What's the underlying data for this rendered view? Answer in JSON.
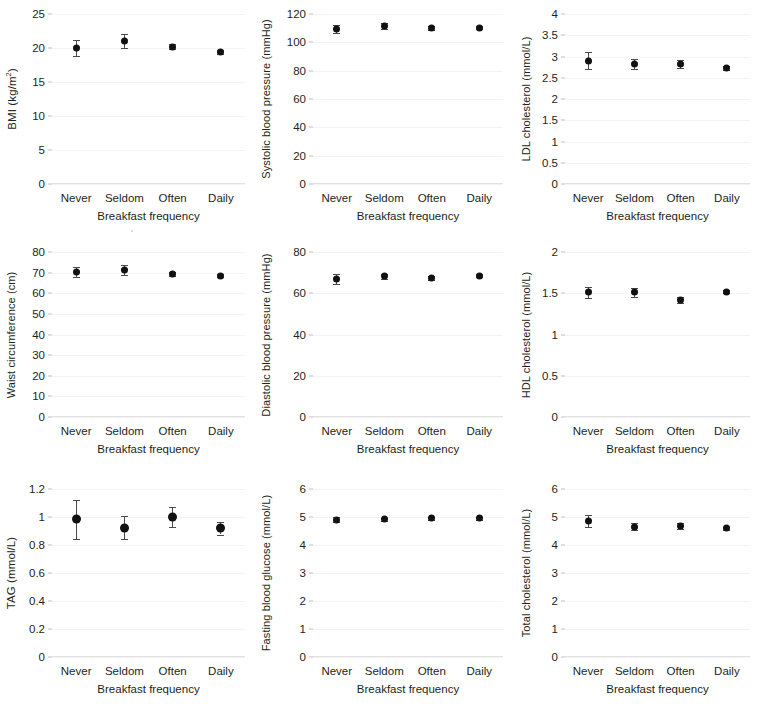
{
  "figure": {
    "xlabel": "Breakfast frequency",
    "categories": [
      "Never",
      "Seldom",
      "Often",
      "Daily"
    ],
    "marker_color": "#111111",
    "errorbar_color": "#4a4a4a",
    "gridline_color": "#f3f3f3"
  },
  "chart_data": [
    {
      "type": "scatter",
      "panel": 1,
      "title": "",
      "ylabel": "BMI (kg/m2)",
      "ylabel_html": "BMI (kg/m<sup>2</sup>)",
      "xlabel": "Breakfast frequency",
      "categories": [
        "Never",
        "Seldom",
        "Often",
        "Daily"
      ],
      "values": [
        20.0,
        21.0,
        20.2,
        19.4
      ],
      "err_low": [
        1.2,
        1.0,
        0.4,
        0.25
      ],
      "err_high": [
        1.2,
        1.0,
        0.4,
        0.25
      ],
      "ylim": [
        0,
        25
      ],
      "yticks": [
        0,
        5,
        10,
        15,
        20,
        25
      ],
      "ytick_labels": [
        "0",
        "5",
        "10",
        "15",
        "20",
        "25"
      ],
      "grid": true
    },
    {
      "type": "scatter",
      "panel": 2,
      "title": "",
      "ylabel": "Systolic blood pressure (mmHg)",
      "ylabel_html": "Systolic blood pressure (mmHg)",
      "xlabel": "Breakfast frequency",
      "categories": [
        "Never",
        "Seldom",
        "Often",
        "Daily"
      ],
      "values": [
        109.5,
        111.8,
        110.0,
        110.3
      ],
      "err_low": [
        3.0,
        2.2,
        1.3,
        0.9
      ],
      "err_high": [
        3.0,
        2.2,
        1.3,
        0.9
      ],
      "ylim": [
        0,
        120
      ],
      "yticks": [
        0,
        20,
        40,
        60,
        80,
        100,
        120
      ],
      "ytick_labels": [
        "0",
        "20",
        "40",
        "60",
        "80",
        "100",
        "120"
      ],
      "grid": true
    },
    {
      "type": "scatter",
      "panel": 3,
      "title": "",
      "ylabel": "LDL cholesterol (mmol/L)",
      "ylabel_html": "LDL cholesterol (mmol/L)",
      "xlabel": "Breakfast frequency",
      "categories": [
        "Never",
        "Seldom",
        "Often",
        "Daily"
      ],
      "values": [
        2.9,
        2.82,
        2.82,
        2.73
      ],
      "err_low": [
        0.2,
        0.12,
        0.09,
        0.05
      ],
      "err_high": [
        0.2,
        0.12,
        0.09,
        0.05
      ],
      "ylim": [
        0,
        4
      ],
      "yticks": [
        0,
        0.5,
        1,
        1.5,
        2,
        2.5,
        3,
        3.5,
        4
      ],
      "ytick_labels": [
        "0",
        "0.5",
        "1",
        "1.5",
        "2",
        "2.5",
        "3",
        "3.5",
        "4"
      ],
      "grid": true
    },
    {
      "type": "scatter",
      "panel": 4,
      "title": "",
      "ylabel": "Waist circumference (cm)",
      "ylabel_html": "Waist circumference (cm)",
      "xlabel": "Breakfast frequency",
      "categories": [
        "Never",
        "Seldom",
        "Often",
        "Daily"
      ],
      "values": [
        70.2,
        71.3,
        69.5,
        68.6
      ],
      "err_low": [
        2.4,
        2.4,
        1.0,
        0.7
      ],
      "err_high": [
        2.4,
        2.4,
        1.0,
        0.7
      ],
      "ylim": [
        0,
        80
      ],
      "yticks": [
        0,
        10,
        20,
        30,
        40,
        50,
        60,
        70,
        80
      ],
      "ytick_labels": [
        "0",
        "10",
        "20",
        "30",
        "40",
        "50",
        "60",
        "70",
        "80"
      ],
      "grid": true
    },
    {
      "type": "scatter",
      "panel": 5,
      "title": "",
      "ylabel": "Diastolic blood pressure (mmHg)",
      "ylabel_html": "Diastolic blood pressure (mmHg)",
      "xlabel": "Breakfast frequency",
      "categories": [
        "Never",
        "Seldom",
        "Often",
        "Daily"
      ],
      "values": [
        67.0,
        68.2,
        67.3,
        68.6
      ],
      "err_low": [
        2.3,
        1.3,
        0.9,
        0.6
      ],
      "err_high": [
        2.3,
        1.3,
        0.9,
        0.6
      ],
      "ylim": [
        0,
        80
      ],
      "yticks": [
        0,
        20,
        40,
        60,
        80
      ],
      "ytick_labels": [
        "0",
        "20",
        "40",
        "60",
        "80"
      ],
      "grid": true
    },
    {
      "type": "scatter",
      "panel": 6,
      "title": "",
      "ylabel": "HDL cholesterol (mmol/L)",
      "ylabel_html": "HDL cholesterol (mmol/L)",
      "xlabel": "Breakfast frequency",
      "categories": [
        "Never",
        "Seldom",
        "Often",
        "Daily"
      ],
      "values": [
        1.51,
        1.51,
        1.42,
        1.52
      ],
      "err_low": [
        0.07,
        0.05,
        0.04,
        0.02
      ],
      "err_high": [
        0.07,
        0.05,
        0.04,
        0.02
      ],
      "ylim": [
        0,
        2
      ],
      "yticks": [
        0,
        0.5,
        1,
        1.5,
        2
      ],
      "ytick_labels": [
        "0",
        "0.5",
        "1",
        "1.5",
        "2"
      ],
      "grid": true
    },
    {
      "type": "scatter",
      "panel": 7,
      "title": "",
      "ylabel": "TAG (mmol/L)",
      "ylabel_html": "TAG (mmol/L)",
      "xlabel": "Breakfast frequency",
      "categories": [
        "Never",
        "Seldom",
        "Often",
        "Daily"
      ],
      "values": [
        0.985,
        0.925,
        1.0,
        0.92
      ],
      "err_low": [
        0.14,
        0.08,
        0.07,
        0.045
      ],
      "err_high": [
        0.14,
        0.08,
        0.07,
        0.045
      ],
      "ylim": [
        0,
        1.2
      ],
      "yticks": [
        0,
        0.2,
        0.4,
        0.6,
        0.8,
        1,
        1.2
      ],
      "ytick_labels": [
        "0",
        "0.2",
        "0.4",
        "0.6",
        "0.8",
        "1",
        "1.2"
      ],
      "grid": true
    },
    {
      "type": "scatter",
      "panel": 8,
      "title": "",
      "ylabel": "Fasting blood glucose (mmol/L)",
      "ylabel_html": "Fasting blood glucose (mmol/L)",
      "xlabel": "Breakfast frequency",
      "categories": [
        "Never",
        "Seldom",
        "Often",
        "Daily"
      ],
      "values": [
        4.9,
        4.92,
        4.95,
        4.95
      ],
      "err_low": [
        0.09,
        0.06,
        0.05,
        0.04
      ],
      "err_high": [
        0.09,
        0.06,
        0.05,
        0.04
      ],
      "ylim": [
        0,
        6
      ],
      "yticks": [
        0,
        1,
        2,
        3,
        4,
        5,
        6
      ],
      "ytick_labels": [
        "0",
        "1",
        "2",
        "3",
        "4",
        "5",
        "6"
      ],
      "grid": true
    },
    {
      "type": "scatter",
      "panel": 9,
      "title": "",
      "ylabel": "Total cholesterol (mmol/L)",
      "ylabel_html": "Total cholesterol (mmol/L)",
      "xlabel": "Breakfast frequency",
      "categories": [
        "Never",
        "Seldom",
        "Often",
        "Daily"
      ],
      "values": [
        4.85,
        4.66,
        4.68,
        4.6
      ],
      "err_low": [
        0.22,
        0.14,
        0.11,
        0.05
      ],
      "err_high": [
        0.22,
        0.14,
        0.11,
        0.05
      ],
      "ylim": [
        0,
        6
      ],
      "yticks": [
        0,
        1,
        2,
        3,
        4,
        5,
        6
      ],
      "ytick_labels": [
        "0",
        "1",
        "2",
        "3",
        "4",
        "5",
        "6"
      ],
      "grid": true
    }
  ]
}
